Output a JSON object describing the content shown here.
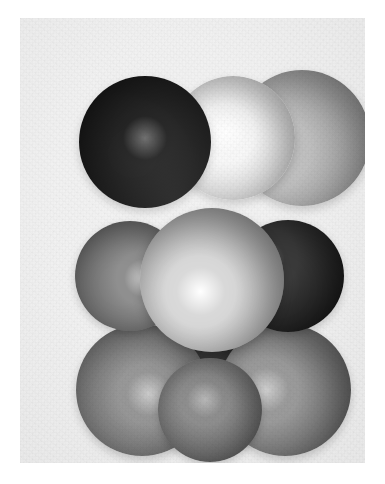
{
  "figure": {
    "caption": "",
    "background_color": "#ffffff",
    "panel_color": "#f0f0f0",
    "panel": {
      "x": 20,
      "y": 18,
      "width": 345,
      "height": 445
    }
  },
  "chart_data": {
    "type": "scatter",
    "xlabel": "",
    "ylabel": "",
    "grid": false,
    "legend": null,
    "spheres": [
      {
        "id": "sphere-top-left-black",
        "label": "top-left dark sphere",
        "row": "top",
        "cx": 125,
        "cy": 124,
        "r": 66,
        "base_color": "#0d0d0d",
        "shade_dark": "#000000",
        "highlight_color": "#5e5e5e",
        "highlight_x": 50,
        "highlight_y": 47,
        "z": 30
      },
      {
        "id": "sphere-top-center-white",
        "label": "top-center bright white sphere",
        "row": "top",
        "cx": 213,
        "cy": 120,
        "r": 62,
        "base_color": "#f7f7f7",
        "shade_dark": "#c7c7c7",
        "highlight_color": "#ffffff",
        "highlight_x": 44,
        "highlight_y": 46,
        "z": 20
      },
      {
        "id": "sphere-top-right-light-gray",
        "label": "top-right light gray sphere",
        "row": "top",
        "cx": 282,
        "cy": 120,
        "r": 68,
        "base_color": "#bdbdbd",
        "shade_dark": "#8f8f8f",
        "highlight_color": "#fdfdfd",
        "highlight_x": 27,
        "highlight_y": 60,
        "z": 10
      },
      {
        "id": "sphere-mid-left-gray",
        "label": "middle-left medium gray sphere",
        "row": "middle",
        "cx": 110,
        "cy": 258,
        "r": 55,
        "base_color": "#8f8f8f",
        "shade_dark": "#5a5a5a",
        "highlight_color": "#cfcfcf",
        "highlight_x": 62,
        "highlight_y": 52,
        "z": 50
      },
      {
        "id": "sphere-mid-right-dark",
        "label": "middle-right dark sphere",
        "row": "middle",
        "cx": 268,
        "cy": 258,
        "r": 56,
        "base_color": "#3a3a3a",
        "shade_dark": "#141414",
        "highlight_color": "#6d6d6d",
        "highlight_x": 30,
        "highlight_y": 35,
        "z": 45
      },
      {
        "id": "sphere-center-bright",
        "label": "central bright sphere with specular highlight",
        "row": "middle",
        "cx": 192,
        "cy": 262,
        "r": 72,
        "base_color": "#d9d9d9",
        "shade_dark": "#8c8c8c",
        "highlight_color": "#ffffff",
        "highlight_x": 42,
        "highlight_y": 58,
        "z": 70
      },
      {
        "id": "sphere-bottom-back-dark",
        "label": "bottom-center dark rear sphere",
        "row": "bottom",
        "cx": 190,
        "cy": 372,
        "r": 58,
        "base_color": "#2b2b2b",
        "shade_dark": "#0a0a0a",
        "highlight_color": "#5a5a5a",
        "highlight_x": 48,
        "highlight_y": 42,
        "z": 15
      },
      {
        "id": "sphere-bottom-left-gray",
        "label": "bottom-left gray sphere",
        "row": "bottom",
        "cx": 122,
        "cy": 372,
        "r": 66,
        "base_color": "#949494",
        "shade_dark": "#5d5d5d",
        "highlight_color": "#cacaca",
        "highlight_x": 55,
        "highlight_y": 53,
        "z": 25
      },
      {
        "id": "sphere-bottom-right-gray",
        "label": "bottom-right gray sphere",
        "row": "bottom",
        "cx": 265,
        "cy": 372,
        "r": 66,
        "base_color": "#9a9a9a",
        "shade_dark": "#5f5f5f",
        "highlight_color": "#cfcfcf",
        "highlight_x": 36,
        "highlight_y": 50,
        "z": 26
      },
      {
        "id": "sphere-bottom-center-front-gray",
        "label": "bottom-center front gray sphere",
        "row": "bottom",
        "cx": 190,
        "cy": 392,
        "r": 52,
        "base_color": "#8b8b8b",
        "shade_dark": "#525252",
        "highlight_color": "#b6b6b6",
        "highlight_x": 45,
        "highlight_y": 40,
        "z": 35
      }
    ],
    "palette": {
      "black_sphere": "#0d0d0d",
      "white_sphere": "#f7f7f7",
      "light_gray_sphere": "#bdbdbd",
      "medium_gray_sphere": "#8f8f8f",
      "dark_gray_sphere": "#3a3a3a",
      "bright_center_sphere": "#d9d9d9",
      "background": "#f0f0f0",
      "page": "#ffffff"
    }
  }
}
